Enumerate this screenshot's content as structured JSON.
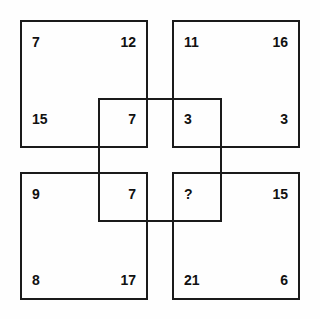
{
  "puzzle": {
    "type": "overlapping-squares-number-grid",
    "background_color": "#fefefe",
    "line_color": "#1a1a1a",
    "text_color": "#111111",
    "missing_marker": "?",
    "squares": [
      {
        "id": "top-left",
        "corners": {
          "top_left": "7",
          "top_right": "12",
          "bottom_left": "15",
          "bottom_right": "7"
        }
      },
      {
        "id": "top-right",
        "corners": {
          "top_left": "11",
          "top_right": "16",
          "bottom_left": "3",
          "bottom_right": "3"
        }
      },
      {
        "id": "bottom-left",
        "corners": {
          "top_left": "9",
          "top_right": "7",
          "bottom_left": "8",
          "bottom_right": "17"
        }
      },
      {
        "id": "bottom-right",
        "corners": {
          "top_left": "?",
          "top_right": "15",
          "bottom_left": "21",
          "bottom_right": "6"
        }
      },
      {
        "id": "center",
        "corners": {
          "top_left": "7",
          "top_right": "3",
          "bottom_left": "7",
          "bottom_right": "?"
        }
      }
    ]
  }
}
